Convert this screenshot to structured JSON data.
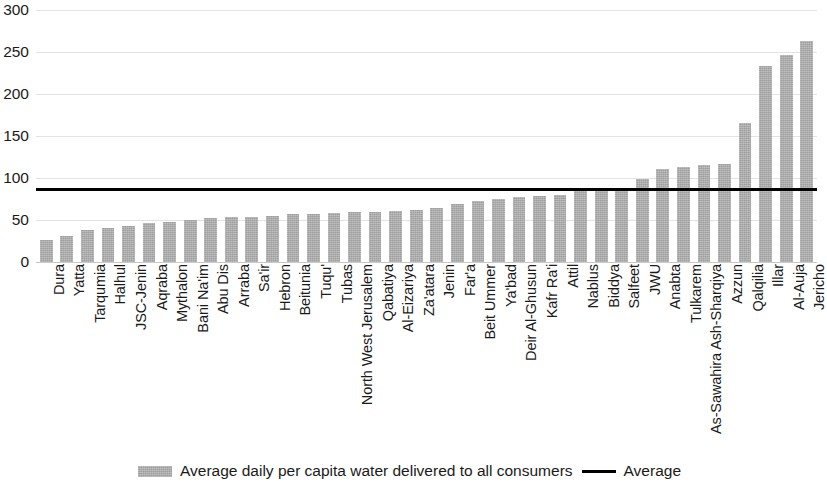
{
  "chart_data": {
    "type": "bar",
    "title": "",
    "xlabel": "",
    "ylabel": "",
    "ylim": [
      0,
      300
    ],
    "ytick_step": 50,
    "yticks": [
      "300",
      "250",
      "200",
      "150",
      "100",
      "50",
      "0"
    ],
    "grid": true,
    "legend_position": "bottom-center",
    "categories": [
      "Dura",
      "Yatta",
      "Tarqumia",
      "Halhul",
      "JSC-Jenin",
      "Aqraba",
      "Mythalon",
      "Bani Na'im",
      "Abu Dis",
      "Arraba",
      "Sa'ir",
      "Hebron",
      "Beitunia",
      "Tuqu'",
      "Tubas",
      "North West Jerusalem",
      "Qabatiya",
      "Al-Eizariya",
      "Za'atara",
      "Jenin",
      "Far'a",
      "Beit Ummer",
      "Ya'bad",
      "Deir Al-Ghusun",
      "Kafr Ra'i",
      "Attil",
      "Nablus",
      "Biddya",
      "Salfeet",
      "JWU",
      "Anabta",
      "Tulkarem",
      "As-Sawahira Ash-Sharqiya",
      "Azzun",
      "Qalqilia",
      "Illar",
      "Al-Auja",
      "Jericho"
    ],
    "series": [
      {
        "name": "Average daily per capita water delivered to all consumers",
        "type": "bar",
        "color": "#adadad",
        "values": [
          26,
          31,
          38,
          40,
          43,
          46,
          48,
          50,
          52,
          53,
          54,
          55,
          57,
          57,
          58,
          59,
          60,
          61,
          62,
          64,
          69,
          73,
          75,
          77,
          78,
          80,
          84,
          84,
          85,
          99,
          111,
          113,
          115,
          117,
          165,
          233,
          246,
          263
        ]
      }
    ],
    "reference_line": {
      "name": "Average",
      "value": 86,
      "color": "#000000"
    }
  },
  "legend": {
    "bar_label": "Average daily per capita water delivered to all consumers",
    "line_label": "Average"
  },
  "icons": {
    "bar_swatch": "bar-swatch-icon",
    "line_swatch": "line-swatch-icon"
  }
}
